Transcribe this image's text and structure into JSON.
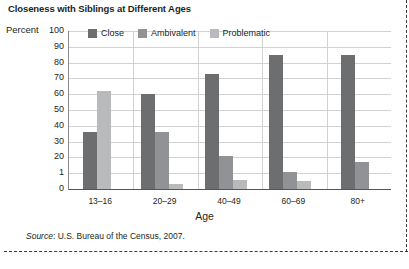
{
  "title": "Closeness with Siblings at Different Ages",
  "percent_label": "Percent",
  "source": {
    "label": "Source",
    "text": ": U.S. Bureau of the Census, 2007."
  },
  "legend": [
    {
      "label": "Close",
      "color": "#6d6e70"
    },
    {
      "label": "Ambivalent",
      "color": "#909295"
    },
    {
      "label": "Problematic",
      "color": "#b8babc"
    }
  ],
  "axis": {
    "x_title": "Age",
    "y_ticks": [
      "100",
      "90",
      "80",
      "70",
      "60",
      "50",
      "40",
      "30",
      "20",
      "1",
      "0"
    ]
  },
  "chart_data": {
    "type": "bar",
    "title": "Closeness with Siblings at Different Ages",
    "xlabel": "Age",
    "ylabel": "Percent",
    "ylim": [
      0,
      100
    ],
    "grid": true,
    "legend_position": "top-inside",
    "categories": [
      "13–16",
      "20–29",
      "40–49",
      "60–69",
      "80+"
    ],
    "series": [
      {
        "name": "Close",
        "color": "#6d6e70",
        "values": [
          36,
          60,
          73,
          85,
          85
        ]
      },
      {
        "name": "Ambivalent",
        "color": "#909295",
        "values": [
          null,
          36,
          21,
          11,
          17
        ]
      },
      {
        "name": "Problematic",
        "color": "#b8babc",
        "values": [
          62,
          3,
          6,
          5,
          null
        ]
      }
    ],
    "source": "Source: U.S. Bureau of the Census, 2007."
  }
}
